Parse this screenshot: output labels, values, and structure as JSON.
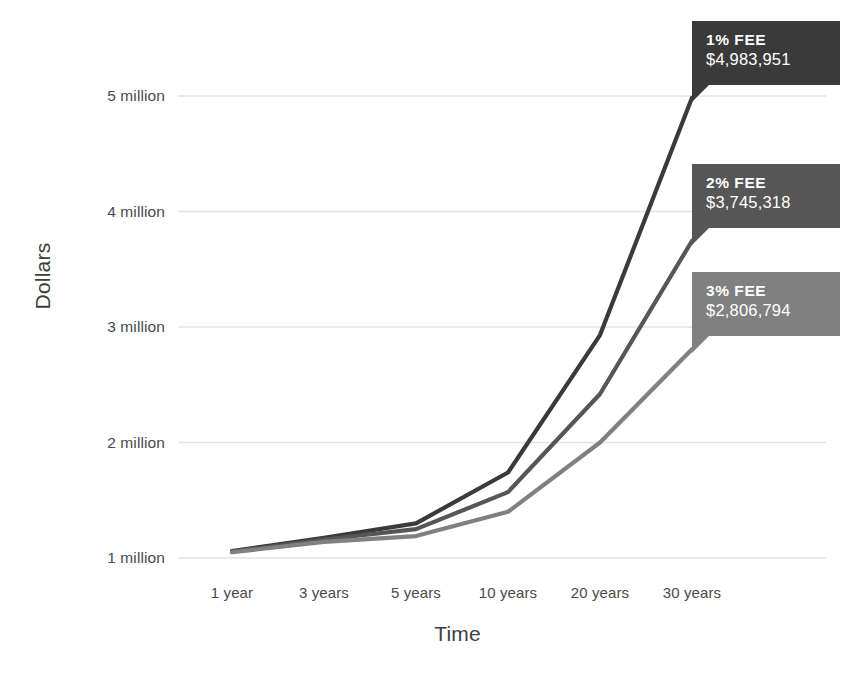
{
  "chart_data": {
    "type": "line",
    "title": "",
    "xlabel": "Time",
    "ylabel": "Dollars",
    "categories": [
      "1 year",
      "3 years",
      "5 years",
      "10 years",
      "20 years",
      "30 years"
    ],
    "ytick_labels": [
      "1 million",
      "2 million",
      "3 million",
      "4 million",
      "5 million"
    ],
    "ytick_values": [
      1000000,
      2000000,
      3000000,
      4000000,
      5000000
    ],
    "ylim": [
      950000,
      5250000
    ],
    "grid": true,
    "legend_position": "inline-callouts",
    "series": [
      {
        "name": "1% FEE",
        "color": "#3a3a3a",
        "values": [
          1060000,
          1175000,
          1300000,
          1740000,
          2930000,
          4983951
        ],
        "end_label_title": "1% FEE",
        "end_label_value": "$4,983,951"
      },
      {
        "name": "2% FEE",
        "color": "#565656",
        "values": [
          1055000,
          1160000,
          1250000,
          1570000,
          2420000,
          3745318
        ],
        "end_label_title": "2% FEE",
        "end_label_value": "$3,745,318"
      },
      {
        "name": "3% FEE",
        "color": "#808080",
        "values": [
          1050000,
          1140000,
          1190000,
          1400000,
          2000000,
          2806794
        ],
        "end_label_title": "3% FEE",
        "end_label_value": "$2,806,794"
      }
    ],
    "colors": {
      "grid": "#e3e3e5",
      "axis_text": "#4a4a4a",
      "axis_title": "#3d3d3d",
      "background": "#ffffff"
    }
  },
  "cropped_header": {
    "text": "——  —  ———  —— — ——"
  }
}
